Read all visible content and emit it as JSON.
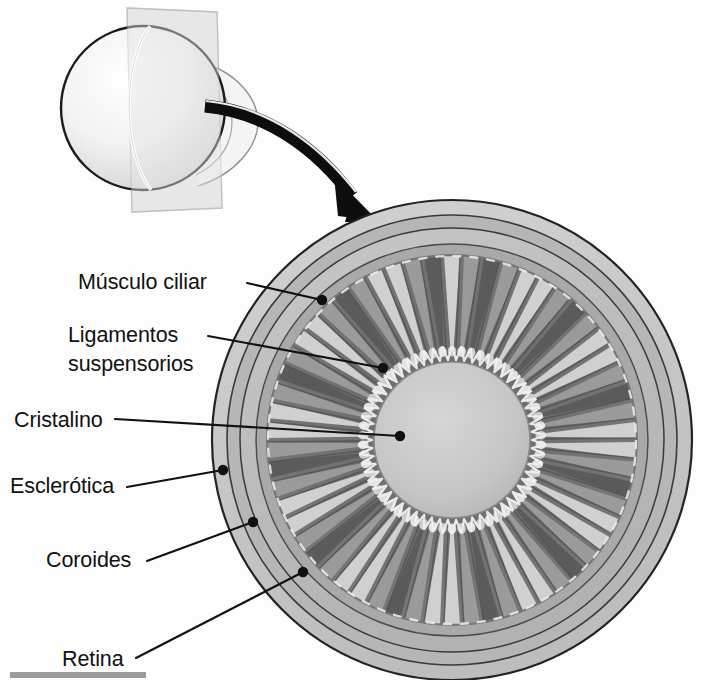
{
  "figure": {
    "background_color": "#fdfdfd",
    "line_color": "#111111",
    "caption_bar": {
      "name": "bottom-rule",
      "color": "#9a9a9a",
      "visible": true
    }
  },
  "inset": {
    "name": "eyeball-3d-inset",
    "description": "Globo ocular tridimensional con plano de corte",
    "sphere_fill_light": "#fbfbfb",
    "sphere_fill_shadow": "#d2d2d2",
    "plane_fill": "#e9e9e9",
    "plane_stroke": "#b8b8b8",
    "outline_color": "#1c1c1c"
  },
  "arrow": {
    "name": "zoom-arrow",
    "description": "Flecha curva que indica la ampliación de la sección",
    "color": "#0d0d0d"
  },
  "eye": {
    "name": "eye-cross-section",
    "center_x": 452,
    "center_y": 440,
    "outer_radius": 240,
    "layers": [
      {
        "name": "sclera-band",
        "outer_r": 240,
        "inner_r": 225,
        "fill": "#c8c8c8"
      },
      {
        "name": "choroid-band",
        "outer_r": 225,
        "inner_r": 212,
        "fill": "#b4b4b4"
      },
      {
        "name": "retina-band",
        "outer_r": 212,
        "inner_r": 196,
        "fill": "#c0c0c0"
      },
      {
        "name": "inner-rim",
        "outer_r": 196,
        "inner_r": 186,
        "fill": "#ababab"
      },
      {
        "name": "ciliary-body",
        "outer_r": 186,
        "inner_r": 78,
        "fill": "#6e6e6e"
      }
    ],
    "lens": {
      "name": "lens-disc",
      "radius": 78,
      "fill": "#c6c6c6",
      "stroke": "#8a8a8a"
    },
    "ciliary_processes": {
      "count": 58,
      "fill_light": "#d8d8d8",
      "fill_mid": "#9e9e9e",
      "fill_dark": "#5a5a5a"
    },
    "zonule_fibers": {
      "name": "suspensory-ligament-fibers",
      "count": 62,
      "color": "#efefef"
    }
  },
  "labels": [
    {
      "id": "musculo-ciliar",
      "name": "label-musculo-ciliar",
      "text": "Músculo ciliar",
      "lines": [
        "Músculo ciliar"
      ],
      "text_x": 78,
      "text_y": 289,
      "anchor": "start",
      "leader": {
        "x1": 247,
        "y1": 283,
        "x2": 322,
        "y2": 300
      },
      "dot": {
        "x": 322,
        "y": 300,
        "r": 5.2
      }
    },
    {
      "id": "ligamentos-suspensorios",
      "name": "label-ligamentos-suspensorios",
      "text": "Ligamentos suspensorios",
      "lines": [
        "Ligamentos",
        "suspensorios"
      ],
      "text_x": 68,
      "text_y": 342,
      "anchor": "start",
      "leader": {
        "x1": 208,
        "y1": 336,
        "x2": 383,
        "y2": 368
      },
      "dot": {
        "x": 383,
        "y": 368,
        "r": 5.2
      }
    },
    {
      "id": "cristalino",
      "name": "label-cristalino",
      "text": "Cristalino",
      "lines": [
        "Cristalino"
      ],
      "text_x": 14,
      "text_y": 427,
      "anchor": "start",
      "leader": {
        "x1": 115,
        "y1": 419,
        "x2": 400,
        "y2": 436
      },
      "dot": {
        "x": 400,
        "y": 436,
        "r": 5.2
      }
    },
    {
      "id": "esclerotica",
      "name": "label-esclerotica",
      "text": "Esclerótica",
      "lines": [
        "Esclerótica"
      ],
      "text_x": 10,
      "text_y": 493,
      "anchor": "start",
      "leader": {
        "x1": 127,
        "y1": 487,
        "x2": 223,
        "y2": 470
      },
      "dot": {
        "x": 223,
        "y": 470,
        "r": 5.2
      }
    },
    {
      "id": "coroides",
      "name": "label-coroides",
      "text": "Coroides",
      "lines": [
        "Coroides"
      ],
      "text_x": 46,
      "text_y": 567,
      "anchor": "start",
      "leader": {
        "x1": 147,
        "y1": 561,
        "x2": 253,
        "y2": 522
      },
      "dot": {
        "x": 253,
        "y": 522,
        "r": 5.2
      }
    },
    {
      "id": "retina",
      "name": "label-retina",
      "text": "Retina",
      "lines": [
        "Retina"
      ],
      "text_x": 62,
      "text_y": 666,
      "anchor": "start",
      "leader": {
        "x1": 136,
        "y1": 658,
        "x2": 303,
        "y2": 572
      },
      "dot": {
        "x": 303,
        "y": 572,
        "r": 5.2
      }
    }
  ]
}
